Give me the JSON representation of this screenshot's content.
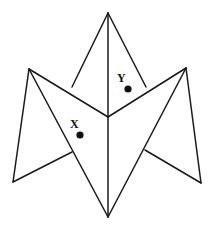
{
  "figure": {
    "name": "folded-polygon-diagram",
    "background_color": "#ffffff",
    "stroke_color": "#1a1a1a",
    "stroke_width": 1.5,
    "dot_color": "#111111",
    "canvas": {
      "width": 213,
      "height": 228
    },
    "vertices": {
      "top_apex": {
        "x": 108,
        "y": 13
      },
      "left_upper": {
        "x": 29,
        "y": 69
      },
      "right_upper": {
        "x": 186,
        "y": 68
      },
      "center": {
        "x": 108,
        "y": 117
      },
      "bottom_left": {
        "x": 13,
        "y": 182
      },
      "bottom_right": {
        "x": 201,
        "y": 183
      },
      "bottom_apex": {
        "x": 108,
        "y": 217
      },
      "left_fold_junction": {
        "x": 72,
        "y": 87
      },
      "right_fold_junction": {
        "x": 146,
        "y": 87
      },
      "left_lower_junction": {
        "x": 72,
        "y": 152
      },
      "right_lower_junction": {
        "x": 145,
        "y": 150
      }
    },
    "segments": [
      {
        "name": "top-apex-to-center-spine",
        "x1": 108,
        "y1": 13,
        "x2": 108,
        "y2": 117
      },
      {
        "name": "center-to-bottom-apex-spine",
        "x1": 108,
        "y1": 117,
        "x2": 108,
        "y2": 217
      },
      {
        "name": "top-apex-to-left-fold",
        "x1": 108,
        "y1": 13,
        "x2": 72,
        "y2": 87
      },
      {
        "name": "top-apex-to-right-fold",
        "x1": 108,
        "y1": 13,
        "x2": 146,
        "y2": 87
      },
      {
        "name": "left-upper-to-center",
        "x1": 29,
        "y1": 69,
        "x2": 108,
        "y2": 117
      },
      {
        "name": "right-upper-to-center",
        "x1": 186,
        "y1": 68,
        "x2": 108,
        "y2": 117
      },
      {
        "name": "left-upper-to-bottom-left",
        "x1": 29,
        "y1": 69,
        "x2": 13,
        "y2": 182
      },
      {
        "name": "right-upper-to-bottom-right",
        "x1": 186,
        "y1": 68,
        "x2": 201,
        "y2": 183
      },
      {
        "name": "left-upper-to-bottom-apex",
        "x1": 29,
        "y1": 69,
        "x2": 108,
        "y2": 217
      },
      {
        "name": "right-upper-to-bottom-apex",
        "x1": 186,
        "y1": 68,
        "x2": 108,
        "y2": 217
      },
      {
        "name": "bottom-left-to-left-lower-junction",
        "x1": 13,
        "y1": 182,
        "x2": 72,
        "y2": 152
      },
      {
        "name": "bottom-right-to-right-lower-junction",
        "x1": 201,
        "y1": 183,
        "x2": 145,
        "y2": 150
      }
    ],
    "points": [
      {
        "id": "point-x",
        "label": "X",
        "label_x": 70,
        "label_y": 118,
        "dot_x": 80,
        "dot_y": 135,
        "dot_radius": 3.6
      },
      {
        "id": "point-y",
        "label": "Y",
        "label_x": 117,
        "label_y": 72,
        "dot_x": 128,
        "dot_y": 89,
        "dot_radius": 3.6
      }
    ]
  }
}
